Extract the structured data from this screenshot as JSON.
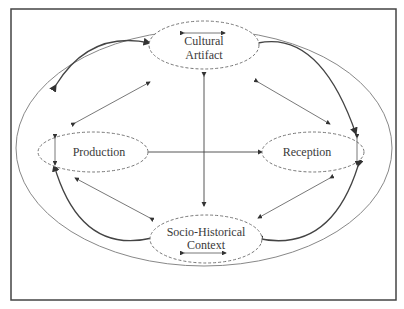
{
  "diagram": {
    "type": "conceptual-cycle",
    "center_label": "R",
    "nodes": {
      "top": {
        "lines": [
          "Cultural",
          "Artifact"
        ]
      },
      "left": {
        "lines": [
          "Production"
        ]
      },
      "right": {
        "lines": [
          "Reception"
        ]
      },
      "bottom": {
        "lines": [
          "Socio-Historical",
          "Context"
        ]
      }
    },
    "edges": [
      {
        "from": "Production",
        "to": "Cultural Artifact",
        "style": "curved-bidirectional"
      },
      {
        "from": "Cultural Artifact",
        "to": "Reception",
        "style": "curved-bidirectional"
      },
      {
        "from": "Reception",
        "to": "Socio-Historical Context",
        "style": "curved-bidirectional"
      },
      {
        "from": "Socio-Historical Context",
        "to": "Production",
        "style": "curved-bidirectional"
      },
      {
        "from": "Production",
        "to": "Reception",
        "style": "straight-bidirectional"
      },
      {
        "from": "Cultural Artifact",
        "to": "Socio-Historical Context",
        "style": "straight-bidirectional"
      }
    ],
    "colors": {
      "line": "#444444",
      "dashed": "#777777",
      "text": "#3a3a3a"
    }
  }
}
